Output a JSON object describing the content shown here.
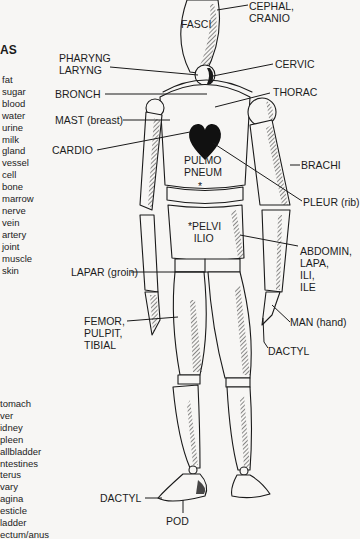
{
  "left_panel": {
    "heading_fragment": "AS",
    "roots_list_1": [
      "fat",
      "sugar",
      "blood",
      "water",
      "urine",
      "milk",
      "gland",
      "vessel",
      "cell",
      "bone",
      "marrow",
      "nerve",
      "vein",
      "artery",
      "joint",
      "muscle",
      "skin"
    ],
    "roots_list_2": [
      "tomach",
      "ver",
      "idney",
      "pleen",
      "allbladder",
      "ntestines",
      "terus",
      "vary",
      "agina",
      "esticle",
      "ladder",
      "ectum/anus"
    ]
  },
  "labels": {
    "fasci": "FASCI",
    "cephal": "CEPHAL,\nCRANIO",
    "pharyng": "PHARYNG\nLARYNG",
    "cervic": "CERVIC",
    "bronch": "BRONCH",
    "thorac": "THORAC",
    "mast": "MAST (breast)",
    "cardio": "CARDIO",
    "pulmo": "PULMO\nPNEUM",
    "pulmo_star": "*",
    "brachi": "BRACHI",
    "pleur": "PLEUR (rib)",
    "pelvi": "*PELVI\n  ILIO",
    "abdomin": "ABDOMIN,\nLAPA,\nILI,\nILE",
    "lapar": "LAPAR (groin)",
    "man": "MAN (hand)",
    "femor": "FEMOR,\nPULPIT,\nTIBIAL",
    "dactyl_hand": "DACTYL",
    "dactyl_foot": "DACTYL",
    "pod": "POD"
  },
  "colors": {
    "ink": "#1a1a1a",
    "paper": "#f7f6f4"
  }
}
